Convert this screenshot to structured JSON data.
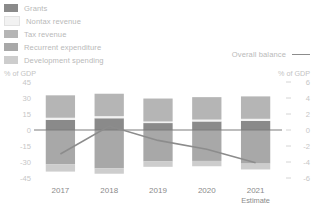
{
  "legend": {
    "items": [
      {
        "label": "Grants",
        "color": "#8a8a8a"
      },
      {
        "label": "Nontax revenue",
        "color": "#f2f2f2"
      },
      {
        "label": "Tax revenue",
        "color": "#b5b5b5"
      },
      {
        "label": "Recurrent expenditure",
        "color": "#a8a8a8"
      },
      {
        "label": "Development spending",
        "color": "#cdcdcd"
      }
    ],
    "line_entry": {
      "label": "Overall balance",
      "color": "#8c8c8c"
    }
  },
  "axes": {
    "left_title": "% of GDP",
    "right_title": "% of GDP",
    "left_ticks": [
      "45",
      "30",
      "15",
      "0",
      "-15",
      "-30",
      "-45"
    ],
    "right_ticks": [
      "6",
      "4",
      "2",
      "0",
      "-2",
      "-4",
      "-6"
    ]
  },
  "categories": [
    {
      "label": "2017",
      "sub": ""
    },
    {
      "label": "2018",
      "sub": ""
    },
    {
      "label": "2019",
      "sub": ""
    },
    {
      "label": "2020",
      "sub": ""
    },
    {
      "label": "2021",
      "sub": "Estimate"
    }
  ],
  "chart_data": {
    "type": "bar",
    "title": "",
    "xlabel": "",
    "ylabel": "% of GDP",
    "ylim": [
      -45,
      45
    ],
    "y2lim": [
      -6,
      6
    ],
    "y2label": "% of GDP",
    "grid": false,
    "legend_position": "top-left",
    "stacked": true,
    "categories": [
      "2017",
      "2018",
      "2019",
      "2020",
      "2021 Estimate"
    ],
    "series": [
      {
        "name": "Grants",
        "axis": "left",
        "color": "#8a8a8a",
        "values": [
          9.5,
          11.0,
          6.5,
          8.0,
          8.5
        ]
      },
      {
        "name": "Nontax revenue",
        "axis": "left",
        "color": "#f2f2f2",
        "values": [
          2.0,
          2.0,
          1.5,
          1.8,
          2.0
        ]
      },
      {
        "name": "Tax revenue",
        "axis": "left",
        "color": "#b5b5b5",
        "values": [
          21.0,
          21.0,
          21.5,
          21.0,
          21.0
        ]
      },
      {
        "name": "Recurrent expenditure",
        "axis": "left",
        "color": "#a8a8a8",
        "values": [
          -32.0,
          -36.0,
          -29.5,
          -29.0,
          -31.5
        ]
      },
      {
        "name": "Development spending",
        "axis": "left",
        "color": "#cdcdcd",
        "values": [
          -7.0,
          -5.0,
          -5.0,
          -5.0,
          -5.5
        ]
      }
    ],
    "line_series": {
      "name": "Overall balance",
      "axis": "right",
      "color": "#8c8c8c",
      "values": [
        -3.0,
        0.5,
        -1.3,
        -2.4,
        -4.1
      ]
    }
  }
}
